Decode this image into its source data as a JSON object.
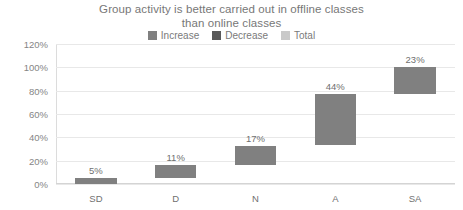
{
  "chart_data": {
    "type": "bar",
    "subtype": "waterfall",
    "title": "Group activity is better carried out in offline classes than online classes",
    "title_lines": [
      "Group activity is better carried out in offline classes",
      "than online classes"
    ],
    "xlabel": "",
    "ylabel": "",
    "categories": [
      "SD",
      "D",
      "N",
      "A",
      "SA"
    ],
    "values": [
      5,
      11,
      17,
      44,
      23
    ],
    "data_labels": [
      "5%",
      "11%",
      "17%",
      "44%",
      "23%"
    ],
    "cumulative_start": [
      0,
      5,
      16,
      33,
      77
    ],
    "cumulative_end": [
      5,
      16,
      33,
      77,
      100
    ],
    "ylim": [
      0,
      120
    ],
    "ytick_values": [
      0,
      20,
      40,
      60,
      80,
      100,
      120
    ],
    "ytick_labels": [
      "0%",
      "20%",
      "40%",
      "60%",
      "80%",
      "100%",
      "120%"
    ],
    "grid": true,
    "legend_position": "top",
    "legend": [
      {
        "label": "Increase",
        "color": "#808080"
      },
      {
        "label": "Decrease",
        "color": "#595959"
      },
      {
        "label": "Total",
        "color": "#c9c9c9"
      }
    ],
    "series_assignment": [
      "Increase",
      "Increase",
      "Increase",
      "Increase",
      "Increase"
    ],
    "bar_color": "#808080"
  },
  "colors": {
    "increase": "#808080",
    "decrease": "#595959",
    "total": "#c9c9c9",
    "gridline": "#e8e8e8",
    "axis": "#d4d4d4",
    "text": "#777777",
    "background": "#ffffff"
  }
}
